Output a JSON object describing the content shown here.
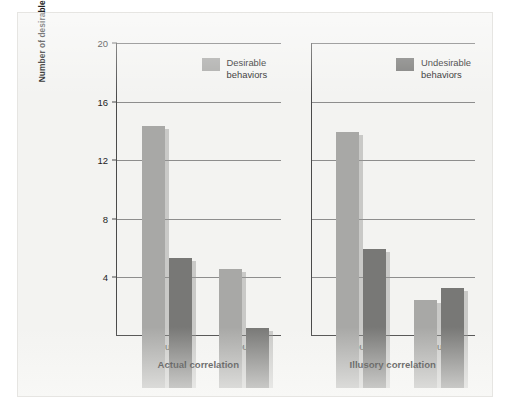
{
  "chart_data": {
    "type": "bar",
    "title": "",
    "subtitle": "",
    "ylabel": "Number of desirable and undesirable behaviors that describe each group",
    "xlabel": "",
    "ylim": [
      0,
      20
    ],
    "yticks": [
      4,
      8,
      12,
      16,
      20
    ],
    "grid": true,
    "legend_position": "top-right of each panel",
    "categories": [
      "Group A",
      "Group B"
    ],
    "series": [
      {
        "name": "Desirable behaviors",
        "color": "#a8a8a6"
      },
      {
        "name": "Undesirable behaviors",
        "color": "#787876"
      }
    ],
    "panels": [
      {
        "label": "Actual correlation",
        "legend": {
          "name": "Desirable behaviors",
          "swatch": "desirable"
        },
        "categories": [
          "Group A",
          "Group B"
        ],
        "series": [
          {
            "name": "Desirable behaviors",
            "values": [
              17.9,
              8.1
            ]
          },
          {
            "name": "Undesirable behaviors",
            "values": [
              8.9,
              4.1
            ]
          }
        ]
      },
      {
        "label": "Illusory correlation",
        "legend": {
          "name": "Undesirable behaviors",
          "swatch": "undesirable"
        },
        "categories": [
          "Group A",
          "Group B"
        ],
        "series": [
          {
            "name": "Desirable behaviors",
            "values": [
              17.5,
              6.0
            ]
          },
          {
            "name": "Undesirable behaviors",
            "values": [
              9.5,
              6.8
            ]
          }
        ]
      }
    ]
  },
  "figure": {
    "y_axis_title": "Number of desirable and undesirable behaviors that describe each group",
    "tick_labels": [
      "20",
      "16",
      "12",
      "8",
      "4"
    ],
    "legends": [
      {
        "label": "Desirable\nbehaviors",
        "swatch": "desirable"
      },
      {
        "label": "Undesirable\nbehaviors",
        "swatch": "undesirable"
      }
    ],
    "panels": [
      {
        "label": "Actual correlation",
        "groups": [
          "Group A",
          "Group B"
        ]
      },
      {
        "label": "Illusory correlation",
        "groups": [
          "Group A",
          "Group B"
        ]
      }
    ],
    "colors": {
      "desirable": "#a8a8a6",
      "undesirable": "#787876",
      "axis": "#4a4a4a",
      "grid": "#8d8d8d",
      "background": "#f3f3f1"
    }
  }
}
